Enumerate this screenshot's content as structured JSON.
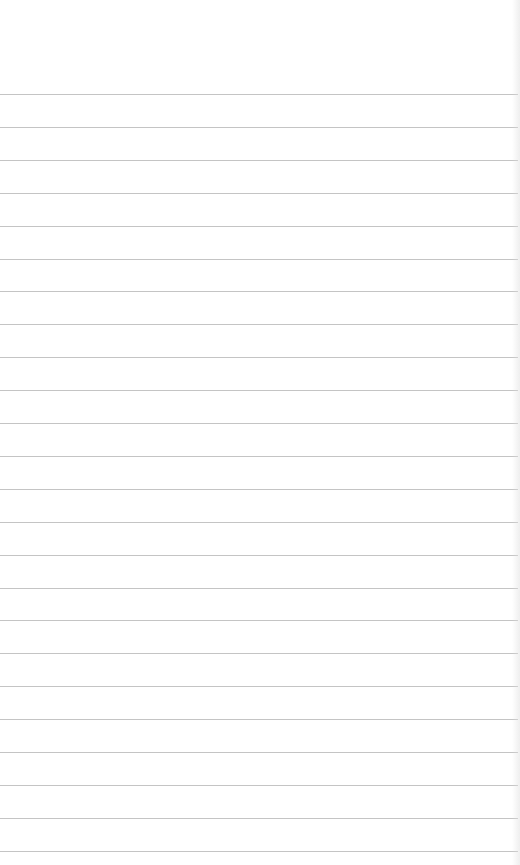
{
  "page": {
    "type": "ruled-notepad",
    "background": "#ffffff",
    "rule_color": "#c4c4c4",
    "first_rule_y": 94,
    "rule_spacing": 32.9,
    "rule_count": 24,
    "text": ""
  }
}
